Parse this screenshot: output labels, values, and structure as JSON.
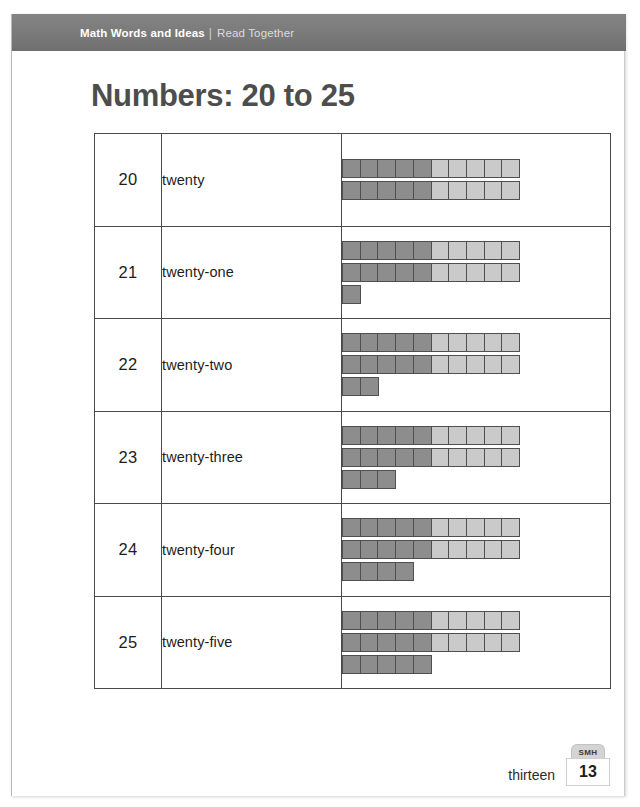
{
  "banner": {
    "primary": "Math Words and Ideas",
    "separator": "|",
    "secondary": "Read Together"
  },
  "title": "Numbers: 20 to 25",
  "table": {
    "rows": [
      {
        "numeral": "20",
        "word": "twenty",
        "total": 20,
        "cube_rows": [
          {
            "dark": 5,
            "light": 5
          },
          {
            "dark": 5,
            "light": 5
          }
        ]
      },
      {
        "numeral": "21",
        "word": "twenty-one",
        "total": 21,
        "cube_rows": [
          {
            "dark": 5,
            "light": 5
          },
          {
            "dark": 5,
            "light": 5
          },
          {
            "dark": 1,
            "light": 0
          }
        ]
      },
      {
        "numeral": "22",
        "word": "twenty-two",
        "total": 22,
        "cube_rows": [
          {
            "dark": 5,
            "light": 5
          },
          {
            "dark": 5,
            "light": 5
          },
          {
            "dark": 2,
            "light": 0
          }
        ]
      },
      {
        "numeral": "23",
        "word": "twenty-three",
        "total": 23,
        "cube_rows": [
          {
            "dark": 5,
            "light": 5
          },
          {
            "dark": 5,
            "light": 5
          },
          {
            "dark": 3,
            "light": 0
          }
        ]
      },
      {
        "numeral": "24",
        "word": "twenty-four",
        "total": 24,
        "cube_rows": [
          {
            "dark": 5,
            "light": 5
          },
          {
            "dark": 5,
            "light": 5
          },
          {
            "dark": 4,
            "light": 0
          }
        ]
      },
      {
        "numeral": "25",
        "word": "twenty-five",
        "total": 25,
        "cube_rows": [
          {
            "dark": 5,
            "light": 5
          },
          {
            "dark": 5,
            "light": 5
          },
          {
            "dark": 5,
            "light": 0
          }
        ]
      }
    ]
  },
  "footer": {
    "page_word": "thirteen",
    "badge_label": "SMH",
    "page_number": "13"
  },
  "colors": {
    "banner_gray": "#7a7a7a",
    "title_gray": "#4d4d4d",
    "cube_dark": "#8d8d8d",
    "cube_light": "#cacaca",
    "cube_border": "#4f4f4f",
    "table_border": "#4a4a4a"
  }
}
